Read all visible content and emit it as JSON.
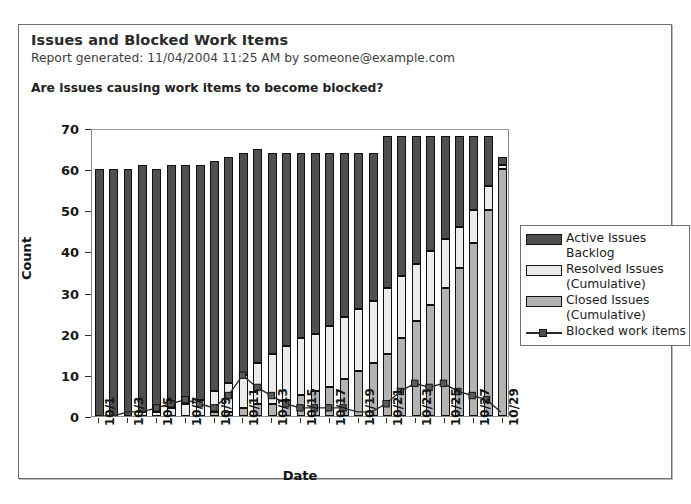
{
  "report": {
    "title": "Issues and Blocked Work Items",
    "generated": "Report generated:  11/04/2004 11:25 AM by someone@example.com",
    "question": "Are issues causing work items to become blocked?"
  },
  "legend": {
    "items": [
      {
        "label": "Active Issues Backlog",
        "line1": "Active Issues",
        "line2": "Backlog",
        "swatch": "sw-active",
        "color": "#4f4f4f",
        "type": "bar"
      },
      {
        "label": "Resolved Issues (Cumulative)",
        "line1": "Resolved Issues",
        "line2": "(Cumulative)",
        "swatch": "sw-resolved",
        "color": "#ececec",
        "type": "bar"
      },
      {
        "label": "Closed Issues (Cumulative)",
        "line1": "Closed Issues",
        "line2": "(Cumulative)",
        "swatch": "sw-closed",
        "color": "#b3b3b3",
        "type": "bar"
      },
      {
        "label": "Blocked work items",
        "line1": "Blocked work items",
        "line2": "",
        "swatch": "sw-line",
        "color": "#2a2a2a",
        "type": "line"
      }
    ]
  },
  "chart_data": {
    "type": "bar",
    "stacked": true,
    "title": "Are issues causing work items to become blocked?",
    "xlabel": "Date",
    "ylabel": "Count",
    "ylim": [
      0,
      70
    ],
    "yticks": [
      0,
      10,
      20,
      30,
      40,
      50,
      60,
      70
    ],
    "grid": false,
    "legend_position": "right",
    "categories": [
      "10/1",
      "10/2",
      "10/3",
      "10/4",
      "10/5",
      "10/6",
      "10/7",
      "10/8",
      "10/9",
      "10/10",
      "10/11",
      "10/12",
      "10/13",
      "10/14",
      "10/15",
      "10/16",
      "10/17",
      "10/18",
      "10/19",
      "10/20",
      "10/21",
      "10/22",
      "10/23",
      "10/24",
      "10/25",
      "10/26",
      "10/27",
      "10/28",
      "10/29"
    ],
    "tick_labels": [
      "10/1",
      "",
      "10/3",
      "",
      "10/5",
      "",
      "10/7",
      "",
      "10/9",
      "",
      "10/11",
      "",
      "10/13",
      "",
      "10/15",
      "",
      "10/17",
      "",
      "10/19",
      "",
      "10/21",
      "",
      "10/23",
      "",
      "10/25",
      "",
      "10/27",
      "",
      "10/29"
    ],
    "series": [
      {
        "name": "Active Issues Backlog",
        "color": "#4f4f4f",
        "values": [
          60,
          60,
          60,
          60,
          59,
          59,
          58,
          57,
          56,
          55,
          54,
          52,
          49,
          47,
          45,
          44,
          42,
          40,
          38,
          36,
          37,
          34,
          31,
          28,
          25,
          22,
          18,
          12,
          2
        ]
      },
      {
        "name": "Resolved Issues (Cumulative)",
        "color": "#ececec",
        "values": [
          0,
          0,
          0,
          1,
          1,
          2,
          3,
          4,
          5,
          7,
          8,
          10,
          12,
          13,
          14,
          14,
          15,
          15,
          15,
          15,
          16,
          15,
          14,
          13,
          12,
          10,
          8,
          6,
          1
        ]
      },
      {
        "name": "Closed Issues (Cumulative)",
        "color": "#b3b3b3",
        "values": [
          0,
          0,
          0,
          0,
          0,
          0,
          0,
          0,
          1,
          1,
          2,
          3,
          3,
          4,
          5,
          6,
          7,
          9,
          11,
          13,
          15,
          19,
          23,
          27,
          31,
          36,
          42,
          50,
          60
        ]
      }
    ],
    "line_series": {
      "name": "Blocked work items",
      "color": "#2a2a2a",
      "marker": "square",
      "values": [
        0,
        0,
        1,
        1,
        2,
        3,
        4,
        3,
        2,
        5,
        10,
        7,
        5,
        3,
        2,
        2,
        2,
        2,
        1,
        1,
        3,
        6,
        8,
        7,
        8,
        6,
        5,
        4,
        1
      ]
    }
  }
}
